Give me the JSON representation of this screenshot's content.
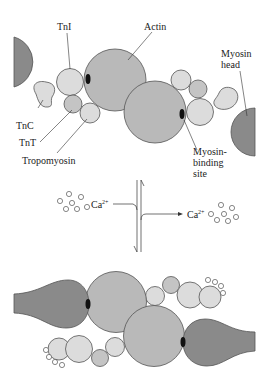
{
  "figure": {
    "type": "diagram"
  },
  "labels": {
    "tni": "TnI",
    "actin": "Actin",
    "myosin_head_line1": "Myosin",
    "myosin_head_line2": "head",
    "tnc": "TnC",
    "tnt": "TnT",
    "tropomyosin": "Tropomyosin",
    "binding_site_line1": "Myosin-",
    "binding_site_line2": "binding",
    "binding_site_line3": "site",
    "calcium_left": "Ca",
    "calcium_left_sup": "2+",
    "calcium_right": "Ca",
    "calcium_right_sup": "2+"
  },
  "colors": {
    "actin": "#b9b9b9",
    "myosin": "#8a8a8a",
    "troponin_light": "#dcdcdc",
    "troponin_mid": "#c4c4c4",
    "outline": "#555555",
    "binding_site": "#111111",
    "background": "#ffffff"
  },
  "panels": [
    {
      "name": "top",
      "state": "relaxed (no Ca2+): tropomyosin blocks myosin-binding sites"
    },
    {
      "name": "middle",
      "state": "Ca2+ binding/release equilibrium arrows"
    },
    {
      "name": "bottom",
      "state": "Ca2+ bound: binding sites exposed, myosin heads attach to actin"
    }
  ]
}
